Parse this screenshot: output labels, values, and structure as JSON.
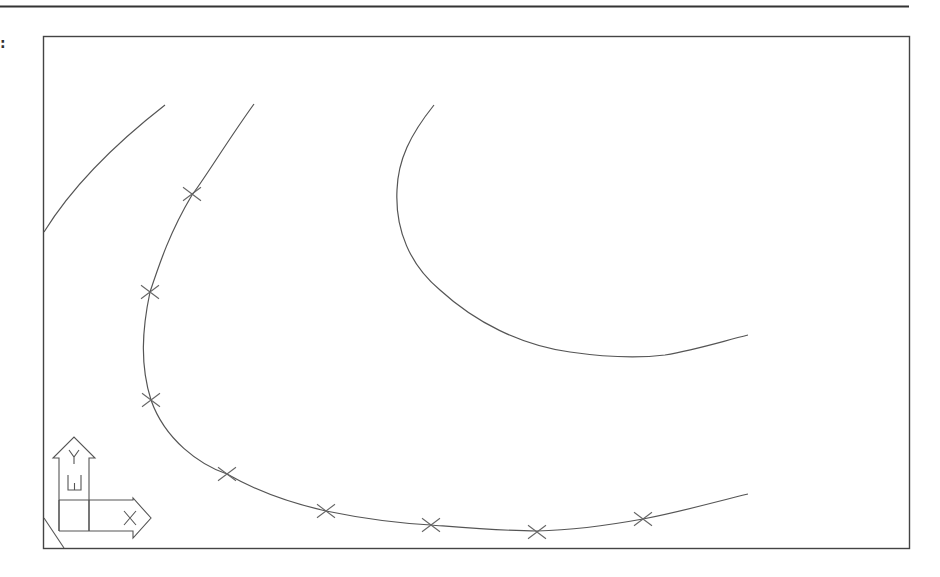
{
  "figure": {
    "label_marker": ":",
    "stroke_color": "#555555",
    "frame_color": "#444444",
    "rule_color": "#333333"
  },
  "viewport": {
    "frame": {
      "x": 43,
      "y": 36,
      "width": 866,
      "height": 512
    }
  },
  "ucs_icon": {
    "y_label": "Y",
    "w_label": "W",
    "x_label": "X"
  },
  "curves": [
    {
      "name": "curve-left-edge",
      "path": "M44 232 C 75 182, 120 140, 165 105"
    },
    {
      "name": "curve-fitted",
      "path": "M254 104 C 228 140, 205 178, 192 195 C 170 232, 160 262, 150 292 C 142 330, 140 365, 151 400 C 165 440, 200 465, 227 474 C 255 490, 290 503, 326 511 C 360 518, 395 523, 431 525 C 470 528, 505 531, 537 531 C 575 530, 610 525, 643 519 C 680 512, 715 502, 748 494"
    },
    {
      "name": "curve-upper-right",
      "path": "M434 105 C 410 135, 398 160, 397 190 C 395 230, 410 265, 440 290 C 475 322, 520 345, 570 352 C 605 357, 640 358, 665 355 C 695 350, 720 342, 748 335"
    }
  ],
  "markers": [
    {
      "x": 192,
      "y": 194
    },
    {
      "x": 150,
      "y": 292
    },
    {
      "x": 151,
      "y": 400
    },
    {
      "x": 227,
      "y": 474
    },
    {
      "x": 326,
      "y": 511
    },
    {
      "x": 431,
      "y": 525
    },
    {
      "x": 537,
      "y": 532
    },
    {
      "x": 643,
      "y": 519
    }
  ]
}
